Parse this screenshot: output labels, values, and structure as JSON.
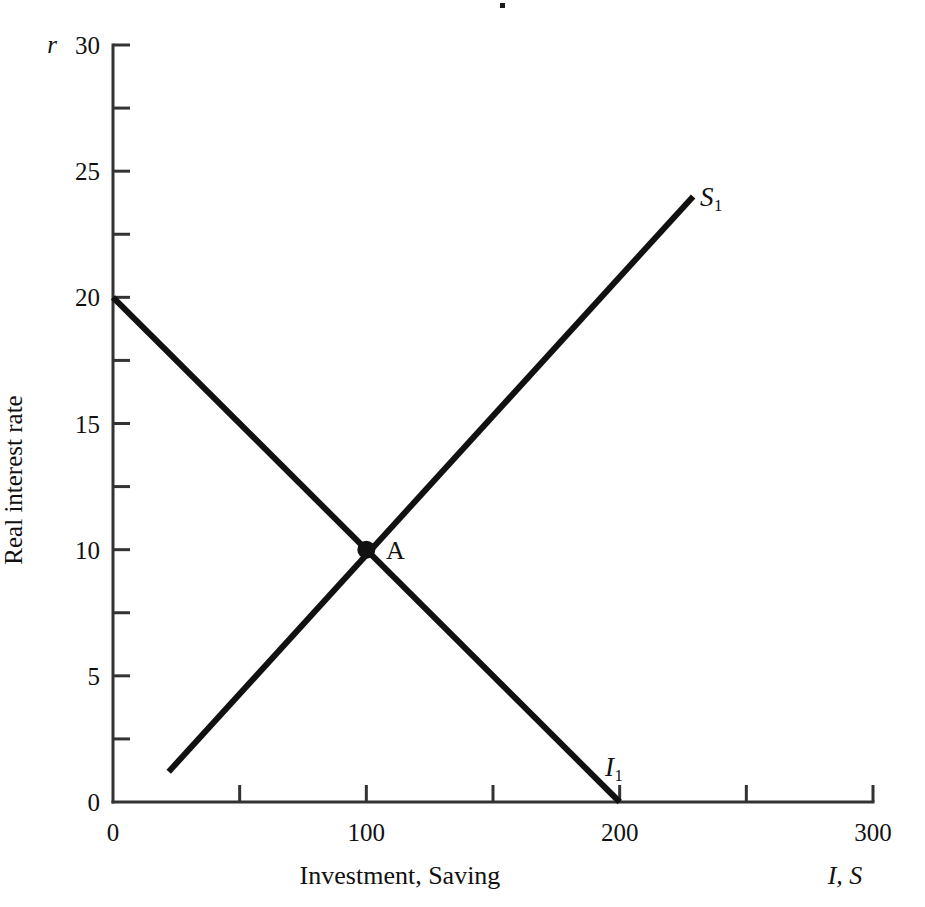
{
  "chart_data": {
    "type": "line",
    "title": "",
    "xlabel": "Investment, Saving",
    "xsymbol": "I, S",
    "ylabel": "Real interest rate",
    "ysymbol": "r",
    "xlim": [
      0,
      300
    ],
    "ylim": [
      0,
      30
    ],
    "grid": false,
    "legend": "inline-curve-labels",
    "x_ticks": [
      {
        "value": 0,
        "label": "0",
        "major": true
      },
      {
        "value": 50,
        "label": "",
        "major": false
      },
      {
        "value": 100,
        "label": "100",
        "major": true
      },
      {
        "value": 150,
        "label": "",
        "major": false
      },
      {
        "value": 200,
        "label": "200",
        "major": true
      },
      {
        "value": 250,
        "label": "",
        "major": false
      },
      {
        "value": 300,
        "label": "300",
        "major": true
      }
    ],
    "y_ticks": [
      {
        "value": 0,
        "label": "0",
        "major": true
      },
      {
        "value": 2.5,
        "label": "",
        "major": false
      },
      {
        "value": 5,
        "label": "5",
        "major": true
      },
      {
        "value": 7.5,
        "label": "",
        "major": false
      },
      {
        "value": 10,
        "label": "10",
        "major": true
      },
      {
        "value": 12.5,
        "label": "",
        "major": false
      },
      {
        "value": 15,
        "label": "15",
        "major": true
      },
      {
        "value": 17.5,
        "label": "",
        "major": false
      },
      {
        "value": 20,
        "label": "20",
        "major": true
      },
      {
        "value": 22.5,
        "label": "",
        "major": false
      },
      {
        "value": 25,
        "label": "25",
        "major": true
      },
      {
        "value": 27.5,
        "label": "",
        "major": false
      },
      {
        "value": 30,
        "label": "30",
        "major": true
      }
    ],
    "series": [
      {
        "name": "I1",
        "label": "I",
        "label_sub": "1",
        "description": "Investment demand schedule, downward sloping",
        "points": [
          [
            0,
            20
          ],
          [
            200,
            0
          ]
        ],
        "color": "#111111",
        "width": 6,
        "label_x": 215,
        "label_y": 1.6
      },
      {
        "name": "S1",
        "label": "S",
        "label_sub": "1",
        "description": "Saving schedule, upward sloping",
        "points": [
          [
            22,
            1.2
          ],
          [
            229,
            24
          ]
        ],
        "color": "#111111",
        "width": 6,
        "label_x": 238,
        "label_y": 24.2
      }
    ],
    "annotations": [
      {
        "name": "equilibrium-point-a",
        "label": "A",
        "x": 100,
        "y": 10,
        "marker": "filled-circle",
        "marker_radius": 9,
        "color": "#111111"
      }
    ]
  },
  "axis": {
    "color": "#333333",
    "width": 3,
    "tick_length_major": 17,
    "tick_length_minor": 17,
    "y_tick_direction": "inward-right",
    "x_tick_direction": "downward"
  }
}
